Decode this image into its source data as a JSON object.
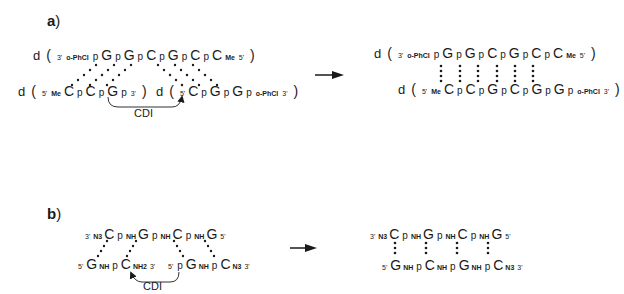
{
  "panel_a": {
    "label": "a",
    "reactant_template": {
      "prefix": "d",
      "end_left": "3'",
      "mod_left": "o-PhCl",
      "units": [
        "p",
        "G",
        "p",
        "G",
        "p",
        "C",
        "p",
        "G",
        "p",
        "C",
        "p",
        "C"
      ],
      "mod_right": "Me",
      "end_right": "5'"
    },
    "reactant_left": {
      "prefix": "d",
      "end_left": "5'",
      "mod_left": "Me",
      "units": [
        "C",
        "p",
        "C",
        "p",
        "G",
        "p"
      ],
      "end_right": "3'"
    },
    "reactant_right": {
      "prefix": "d",
      "end_left": "5'",
      "units": [
        "C",
        "p",
        "G",
        "p",
        "G",
        "p"
      ],
      "mod_right": "o-PhCl",
      "end_right": "3'"
    },
    "reagent": "CDI",
    "product_top": {
      "prefix": "d",
      "end_left": "3'",
      "mod_left": "o-PhCl",
      "units": [
        "p",
        "G",
        "p",
        "G",
        "p",
        "C",
        "p",
        "G",
        "p",
        "C",
        "p",
        "C"
      ],
      "mod_right": "Me",
      "end_right": "5'"
    },
    "product_bottom": {
      "prefix": "d",
      "end_left": "5'",
      "mod_left": "Me",
      "units": [
        "C",
        "p",
        "C",
        "p",
        "G",
        "p",
        "C",
        "p",
        "G",
        "p",
        "G",
        "p"
      ],
      "mod_right": "o-PhCl",
      "end_right": "3'"
    }
  },
  "panel_b": {
    "label": "b",
    "reactant_template": {
      "end_left": "3'",
      "mod_left": "N3",
      "units": [
        "C",
        "p",
        "NH",
        "G",
        "p",
        "NH",
        "C",
        "p",
        "NH",
        "G"
      ],
      "end_right": "5'"
    },
    "reactant_left": {
      "end_left": "5'",
      "units": [
        "G",
        "NH",
        "p",
        "C"
      ],
      "mod_right": "NH2",
      "end_right": "3'"
    },
    "reactant_right": {
      "end_left": "5'",
      "units": [
        "p",
        "G",
        "NH",
        "p",
        "C"
      ],
      "mod_right": "N3",
      "end_right": "3'"
    },
    "reagent": "CDI",
    "product_top": {
      "end_left": "3'",
      "mod_left": "N3",
      "units": [
        "C",
        "p",
        "NH",
        "G",
        "p",
        "NH",
        "C",
        "p",
        "NH",
        "G"
      ],
      "end_right": "5'"
    },
    "product_bottom": {
      "end_left": "5'",
      "units": [
        "G",
        "NH",
        "p",
        "C",
        "NH",
        "p",
        "G",
        "NH",
        "p",
        "C"
      ],
      "mod_right": "N3",
      "end_right": "3'"
    }
  },
  "text": {
    "paren_open": "(",
    "paren_close": ")",
    "label_paren": ")"
  }
}
